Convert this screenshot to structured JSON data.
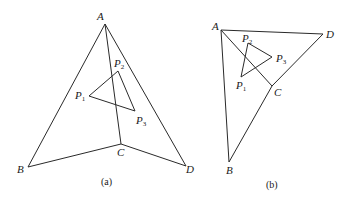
{
  "figures": [
    {
      "id": "a",
      "caption": "(a)",
      "vertices": {
        "A": {
          "label": "A",
          "x": 105,
          "y": 24
        },
        "B": {
          "label": "B",
          "x": 28,
          "y": 167
        },
        "C": {
          "label": "C",
          "x": 121,
          "y": 144
        },
        "D": {
          "label": "D",
          "x": 186,
          "y": 166
        }
      },
      "points": {
        "P1": {
          "label": "P",
          "sub": "1",
          "x": 89,
          "y": 96
        },
        "P2": {
          "label": "P",
          "sub": "2",
          "x": 118,
          "y": 71
        },
        "P3": {
          "label": "P",
          "sub": "3",
          "x": 135,
          "y": 111
        }
      },
      "edges": [
        "A-B",
        "A-C",
        "A-D",
        "B-C",
        "C-D",
        "P1-P2",
        "P2-P3",
        "P3-P1"
      ]
    },
    {
      "id": "b",
      "caption": "(b)",
      "vertices": {
        "A": {
          "label": "A",
          "x": 221,
          "y": 30
        },
        "B": {
          "label": "B",
          "x": 229,
          "y": 162
        },
        "C": {
          "label": "C",
          "x": 272,
          "y": 86
        },
        "D": {
          "label": "D",
          "x": 323,
          "y": 34
        }
      },
      "points": {
        "P1": {
          "label": "P",
          "sub": "1",
          "x": 241,
          "y": 77
        },
        "P2": {
          "label": "P",
          "sub": "2",
          "x": 248,
          "y": 43
        },
        "P3": {
          "label": "P",
          "sub": "3",
          "x": 272,
          "y": 57
        }
      },
      "edges": [
        "A-B",
        "A-C",
        "A-D",
        "B-C",
        "C-D",
        "P1-P2",
        "P2-P3",
        "P3-P1"
      ]
    }
  ]
}
